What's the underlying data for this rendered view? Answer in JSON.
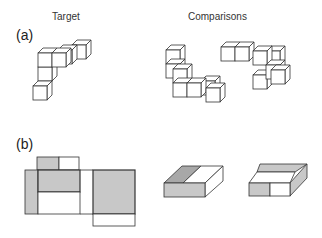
{
  "headings": {
    "target": "Target",
    "comparisons": "Comparisons"
  },
  "panels": [
    {
      "id": "a",
      "label": "(a)",
      "description": "Mental rotation task: 3D cube-assembly target and two comparison figures"
    },
    {
      "id": "b",
      "label": "(b)",
      "description": "Unfolded 2D net with shaded faces and two comparison folded boxes"
    }
  ],
  "colors": {
    "stroke": "#333333",
    "shade": "#c8c8c8",
    "background": "#ffffff"
  }
}
